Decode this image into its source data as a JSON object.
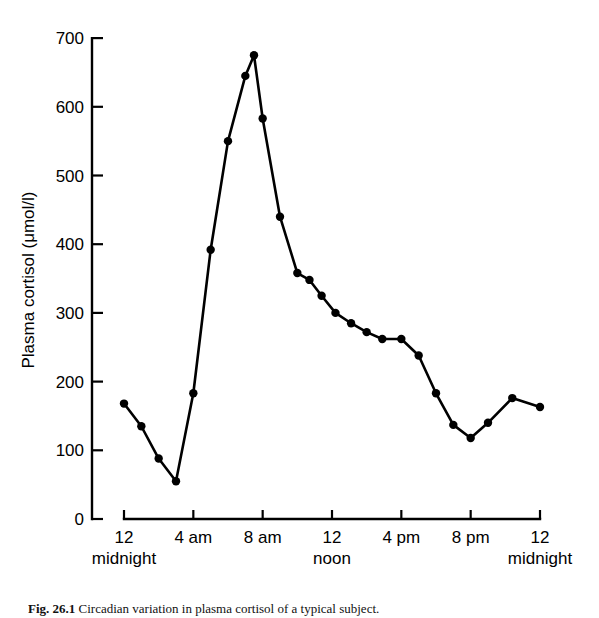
{
  "figure": {
    "caption_label": "Fig. 26.1",
    "caption_text": "Circadian variation in plasma cortisol of a typical subject."
  },
  "chart_data": {
    "type": "line",
    "title": "",
    "xlabel": "",
    "ylabel": "Plasma cortisol (μmol/l)",
    "ylim": [
      0,
      700
    ],
    "xlim": [
      0,
      24
    ],
    "grid": false,
    "legend": "none",
    "y_ticks": [
      0,
      100,
      200,
      300,
      400,
      500,
      600,
      700
    ],
    "y_tick_labels": [
      "0",
      "100",
      "200",
      "300",
      "400",
      "500",
      "600",
      "700"
    ],
    "x_ticks": [
      0,
      4,
      8,
      12,
      16,
      20,
      24
    ],
    "x_tick_labels": [
      "12",
      "4 am",
      "8 am",
      "12",
      "4 pm",
      "8 pm",
      "12"
    ],
    "x_tick_sublabels": [
      "midnight",
      "",
      "",
      "noon",
      "",
      "",
      "midnight"
    ],
    "marker": "filled-circle",
    "line_color": "#000000",
    "marker_color": "#000000",
    "x": [
      0,
      1,
      2,
      3,
      4,
      5,
      6,
      7,
      7.5,
      8,
      9,
      10,
      10.7,
      11.4,
      12.2,
      13.1,
      14,
      14.9,
      16,
      17,
      18,
      19,
      20,
      21,
      22.4,
      24
    ],
    "values": [
      168,
      135,
      88,
      55,
      183,
      392,
      550,
      645,
      675,
      583,
      440,
      358,
      348,
      325,
      300,
      285,
      272,
      262,
      262,
      238,
      183,
      137,
      118,
      140,
      176,
      163
    ]
  },
  "axis_labels": {
    "y_title": "Plasma cortisol (μmol/l)"
  }
}
